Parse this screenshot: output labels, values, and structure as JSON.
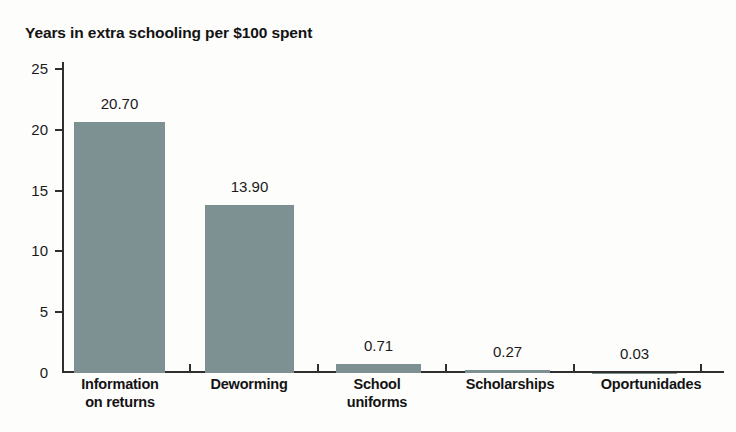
{
  "chart_data": {
    "type": "bar",
    "title": "Years in extra schooling per $100 spent",
    "xlabel": "",
    "ylabel": "",
    "ylim": [
      0,
      25
    ],
    "grid": false,
    "legend": "none",
    "bar_color": "#7d9192",
    "axis_color": "#2f2f2f",
    "background_color": "#fdfdfc",
    "ytick_labels": [
      "25",
      "20",
      "15",
      "10",
      "5",
      "0"
    ],
    "ytick_values": [
      25,
      20,
      15,
      10,
      5,
      0
    ],
    "categories": [
      "Information on returns",
      "Deworming",
      "School uniforms",
      "Scholarships",
      "Oportunidades"
    ],
    "category_lines": [
      [
        "Information",
        "on returns"
      ],
      [
        "Deworming"
      ],
      [
        "School",
        "uniforms"
      ],
      [
        "Scholarships"
      ],
      [
        "Oportunidades"
      ]
    ],
    "values": [
      20.7,
      13.9,
      0.71,
      0.27,
      0.03
    ],
    "value_labels": [
      "20.70",
      "13.90",
      "0.71",
      "0.27",
      "0.03"
    ]
  }
}
